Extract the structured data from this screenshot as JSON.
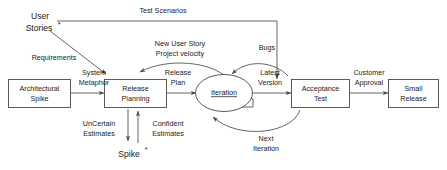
{
  "diagram": {
    "stroke_color": "#4a4a4a",
    "text_color": "#1a1a1a",
    "background": "#ffffff"
  },
  "nodes": [
    {
      "id": "user_stories",
      "shape": "text",
      "line1": "User",
      "line2": "Stories",
      "marker": "*"
    },
    {
      "id": "architectural_spike",
      "shape": "box",
      "line1": "Architectural",
      "line2": "Spike",
      "marker": ""
    },
    {
      "id": "release_planning",
      "shape": "box",
      "line1": "Release",
      "line2": "Planning",
      "marker": ""
    },
    {
      "id": "iteration",
      "shape": "ellipse",
      "line1": "Iteration",
      "line2": "",
      "marker": ""
    },
    {
      "id": "acceptance_test",
      "shape": "box",
      "line1": "Acceptance",
      "line2": "Test",
      "marker": ""
    },
    {
      "id": "small_release",
      "shape": "box",
      "line1": "Small",
      "line2": "Release",
      "marker": ""
    },
    {
      "id": "spike",
      "shape": "text",
      "line1": "Spike",
      "line2": "",
      "marker": "*"
    }
  ],
  "edges": [
    {
      "id": "test_scenarios",
      "label1": "Test Scenarios",
      "label2": "",
      "from": "user_stories",
      "to": "acceptance_test"
    },
    {
      "id": "requirements",
      "label1": "Requirements",
      "label2": "",
      "from": "user_stories",
      "to": "release_planning"
    },
    {
      "id": "system_metaphor",
      "label1": "System",
      "label2": "Metaphor",
      "from": "architectural_spike",
      "to": "release_planning"
    },
    {
      "id": "new_user_story",
      "label1": "New User Story",
      "label2": "Project velocity",
      "from": "iteration",
      "to": "release_planning"
    },
    {
      "id": "release_plan",
      "label1": "Release",
      "label2": "Plan",
      "from": "release_planning",
      "to": "iteration"
    },
    {
      "id": "bugs",
      "label1": "Bugs",
      "label2": "",
      "from": "acceptance_test",
      "to": "iteration"
    },
    {
      "id": "latest_version",
      "label1": "Latest",
      "label2": "Version",
      "from": "iteration",
      "to": "acceptance_test"
    },
    {
      "id": "customer_approval",
      "label1": "Customer",
      "label2": "Approval",
      "from": "acceptance_test",
      "to": "small_release"
    },
    {
      "id": "next_iteration",
      "label1": "Next",
      "label2": "Iteration",
      "from": "acceptance_test",
      "to": "iteration"
    },
    {
      "id": "uncertain_estimates",
      "label1": "UnCertain",
      "label2": "Estimates",
      "from": "release_planning",
      "to": "spike"
    },
    {
      "id": "confident_estimates",
      "label1": "Confident",
      "label2": "Estimates",
      "from": "spike",
      "to": "release_planning"
    }
  ]
}
